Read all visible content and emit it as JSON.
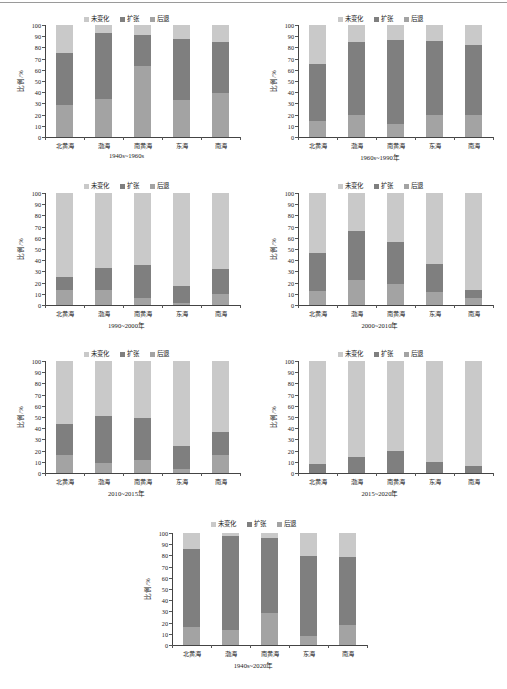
{
  "figure": {
    "y_axis_label": "比例/%",
    "y_ticks": [
      "0",
      "10",
      "20",
      "30",
      "40",
      "50",
      "60",
      "70",
      "80",
      "90",
      "100"
    ],
    "y_min": 0,
    "y_max": 100,
    "categories": [
      "北黄海",
      "渤海",
      "南黄海",
      "东海",
      "南海"
    ],
    "legend": [
      {
        "label": "未变化",
        "color": "#c9c9c9",
        "key": "unchanged"
      },
      {
        "label": "扩张",
        "color": "#7f7f7f",
        "key": "expansion"
      },
      {
        "label": "后退",
        "color": "#a3a3a3",
        "key": "retreat"
      }
    ],
    "colors": {
      "unchanged": "#c9c9c9",
      "expansion": "#7f7f7f",
      "retreat": "#a3a3a3",
      "axis": "#444444",
      "text": "#1a1a1a"
    }
  },
  "chart_data": [
    {
      "type": "bar",
      "stacked": true,
      "title": "1940s~1960s",
      "xlabel": "",
      "ylabel": "比例/%",
      "ylim": [
        0,
        100
      ],
      "grid": false,
      "legend_position": "top-center",
      "categories": [
        "北黄海",
        "渤海",
        "南黄海",
        "东海",
        "南海"
      ],
      "series": [
        {
          "name": "后退",
          "values": [
            29,
            34,
            63,
            33,
            39
          ]
        },
        {
          "name": "扩张",
          "values": [
            46,
            59,
            28,
            54.5,
            45.5
          ]
        },
        {
          "name": "未变化",
          "values": [
            25,
            7,
            9,
            12.5,
            15.5
          ]
        }
      ]
    },
    {
      "type": "bar",
      "stacked": true,
      "title": "1960s~1990年",
      "xlabel": "",
      "ylabel": "比例/%",
      "ylim": [
        0,
        100
      ],
      "grid": false,
      "legend_position": "top-center",
      "categories": [
        "北黄海",
        "渤海",
        "南黄海",
        "东海",
        "南海"
      ],
      "series": [
        {
          "name": "后退",
          "values": [
            14,
            20,
            11.5,
            20,
            20
          ]
        },
        {
          "name": "扩张",
          "values": [
            51,
            65,
            75,
            66,
            62
          ]
        },
        {
          "name": "未变化",
          "values": [
            35,
            15,
            13.5,
            14,
            18
          ]
        }
      ]
    },
    {
      "type": "bar",
      "stacked": true,
      "title": "1990~2000年",
      "xlabel": "",
      "ylabel": "比例/%",
      "ylim": [
        0,
        100
      ],
      "grid": false,
      "legend_position": "top-center",
      "categories": [
        "北黄海",
        "渤海",
        "南黄海",
        "东海",
        "南海"
      ],
      "series": [
        {
          "name": "后退",
          "values": [
            13,
            13.5,
            6,
            1.5,
            10
          ]
        },
        {
          "name": "扩张",
          "values": [
            12,
            20,
            29.5,
            15.5,
            22.5
          ]
        },
        {
          "name": "未变化",
          "values": [
            75,
            66.5,
            64.5,
            83,
            67.5
          ]
        }
      ]
    },
    {
      "type": "bar",
      "stacked": true,
      "title": "2000~2010年",
      "xlabel": "",
      "ylabel": "比例/%",
      "ylim": [
        0,
        100
      ],
      "grid": false,
      "legend_position": "top-center",
      "categories": [
        "北黄海",
        "渤海",
        "南黄海",
        "东海",
        "南海"
      ],
      "series": [
        {
          "name": "后退",
          "values": [
            12.5,
            22,
            19,
            12,
            6.5
          ]
        },
        {
          "name": "扩张",
          "values": [
            34,
            44.5,
            37,
            25,
            6.5
          ]
        },
        {
          "name": "未变化",
          "values": [
            53.5,
            33.5,
            44,
            63,
            87
          ]
        }
      ]
    },
    {
      "type": "bar",
      "stacked": true,
      "title": "2010~2015年",
      "xlabel": "",
      "ylabel": "比例/%",
      "ylim": [
        0,
        100
      ],
      "grid": false,
      "legend_position": "top-center",
      "categories": [
        "北黄海",
        "渤海",
        "南黄海",
        "东海",
        "南海"
      ],
      "series": [
        {
          "name": "后退",
          "values": [
            16.5,
            8.5,
            12,
            3.5,
            16
          ]
        },
        {
          "name": "扩张",
          "values": [
            27.5,
            42,
            37,
            21,
            21
          ]
        },
        {
          "name": "未变化",
          "values": [
            56,
            49.5,
            51,
            75.5,
            63
          ]
        }
      ]
    },
    {
      "type": "bar",
      "stacked": true,
      "title": "2015~2020年",
      "xlabel": "",
      "ylabel": "比例/%",
      "ylim": [
        0,
        100
      ],
      "grid": false,
      "legend_position": "top-center",
      "categories": [
        "北黄海",
        "渤海",
        "南黄海",
        "东海",
        "南海"
      ],
      "series": [
        {
          "name": "后退",
          "values": [
            0,
            0,
            0,
            0,
            0
          ]
        },
        {
          "name": "扩张",
          "values": [
            8,
            14,
            19.5,
            9.5,
            6.5
          ]
        },
        {
          "name": "未变化",
          "values": [
            92,
            86,
            80.5,
            90.5,
            93.5
          ]
        }
      ]
    },
    {
      "type": "bar",
      "stacked": true,
      "title": "1940s~2020年",
      "xlabel": "",
      "ylabel": "比例/%",
      "ylim": [
        0,
        100
      ],
      "grid": false,
      "legend_position": "top-center",
      "categories": [
        "北黄海",
        "渤海",
        "南黄海",
        "东海",
        "南海"
      ],
      "series": [
        {
          "name": "后退",
          "values": [
            16,
            13,
            29,
            8,
            17.5
          ]
        },
        {
          "name": "扩张",
          "values": [
            70,
            84,
            67,
            71.5,
            61
          ]
        },
        {
          "name": "未变化",
          "values": [
            14,
            3,
            4,
            20.5,
            21.5
          ]
        }
      ]
    }
  ]
}
